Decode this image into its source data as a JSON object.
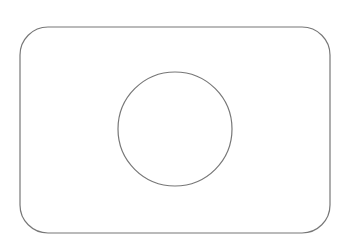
{
  "canvas": {
    "width": 343,
    "height": 247,
    "background": "#ffffff"
  },
  "shapes": {
    "rounded_rect": {
      "x": 20,
      "y": 27,
      "width": 310,
      "height": 206,
      "rx": 28,
      "stroke": "#777777",
      "stroke_width": 1.2,
      "fill": "none"
    },
    "circle": {
      "cx": 175,
      "cy": 129,
      "r": 57,
      "stroke": "#777777",
      "stroke_width": 1.2,
      "fill": "none"
    }
  }
}
